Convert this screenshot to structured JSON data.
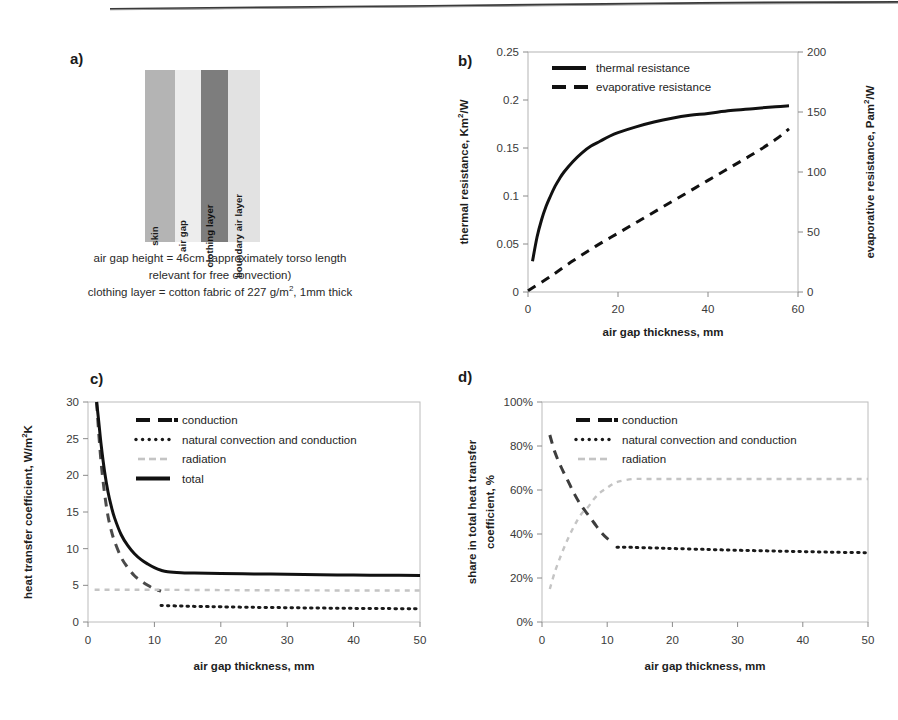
{
  "figure": {
    "panel_a": {
      "letter": "a)",
      "layers": [
        {
          "name": "skin",
          "label": "skin",
          "color": "#b4b4b4"
        },
        {
          "name": "air gap",
          "label": "air gap",
          "color": "#ededed"
        },
        {
          "name": "clothing layer",
          "label": "clothing layer",
          "color": "#7d7d7d"
        },
        {
          "name": "boundary air layer",
          "label": "boundary air layer",
          "color": "#e2e2e2"
        }
      ],
      "caption_line1": "air gap height = 46cm (approximately torso length",
      "caption_line2": "relevant for free convection)",
      "caption_line3_a": "clothing layer = cotton fabric of 227 g/m",
      "caption_line3_sup": "2",
      "caption_line3_b": ", 1mm thick"
    },
    "panel_b": {
      "letter": "b)"
    },
    "panel_c": {
      "letter": "c)"
    },
    "panel_d": {
      "letter": "d)"
    }
  },
  "chart_data": [
    {
      "id": "panel_b",
      "type": "line",
      "title": "",
      "xlabel": "air gap thickness, mm",
      "ylabel": "thermal resistance, Km2/W",
      "ylabel_main": "thermal resistance, Km",
      "ylabel_sup": "2",
      "ylabel_tail": "/W",
      "y2label_main": "evaporative resistance, Pam",
      "y2label_sup": "2",
      "y2label_tail": "/W",
      "xlim": [
        0,
        60
      ],
      "ylim": [
        0,
        0.25
      ],
      "y2lim": [
        0,
        200
      ],
      "xticks": [
        0,
        20,
        40,
        60
      ],
      "yticks": [
        "0",
        "0.05",
        "0.1",
        "0.15",
        "0.2",
        "0.25"
      ],
      "y2ticks": [
        "0",
        "50",
        "100",
        "150",
        "200"
      ],
      "grid": false,
      "legend_position": "top-center",
      "series": [
        {
          "name": "thermal resistance",
          "style": "solid",
          "axis": "left",
          "x": [
            1,
            2,
            3,
            4,
            5,
            6,
            7,
            8,
            10,
            12,
            14,
            16,
            18,
            20,
            24,
            28,
            32,
            36,
            40,
            45,
            50,
            55,
            58
          ],
          "values": [
            0.032,
            0.057,
            0.075,
            0.089,
            0.1,
            0.11,
            0.118,
            0.125,
            0.136,
            0.145,
            0.152,
            0.157,
            0.162,
            0.166,
            0.172,
            0.177,
            0.181,
            0.184,
            0.186,
            0.189,
            0.191,
            0.193,
            0.194
          ]
        },
        {
          "name": "evaporative resistance",
          "style": "dashed",
          "axis": "right",
          "x": [
            0,
            5,
            10,
            15,
            20,
            25,
            30,
            35,
            40,
            45,
            50,
            55,
            58
          ],
          "values": [
            1,
            13,
            26,
            38,
            49,
            60,
            71,
            82,
            93,
            104,
            115,
            127,
            136
          ]
        }
      ]
    },
    {
      "id": "panel_c",
      "type": "line",
      "title": "",
      "xlabel": "air gap thickness, mm",
      "ylabel_main": "heat transfer coefficient, W/m",
      "ylabel_sup": "2",
      "ylabel_tail": "K",
      "xlim": [
        0,
        50
      ],
      "ylim": [
        0,
        30
      ],
      "xticks": [
        0,
        10,
        20,
        30,
        40,
        50
      ],
      "yticks": [
        "0",
        "5",
        "10",
        "15",
        "20",
        "25",
        "30"
      ],
      "grid": false,
      "legend_position": "top-center",
      "series": [
        {
          "name": "conduction",
          "style": "dashed",
          "color": "#4a4a4a",
          "x": [
            1.3,
            1.6,
            2,
            2.5,
            3,
            3.5,
            4,
            5,
            6,
            7,
            8,
            9,
            10,
            11
          ],
          "values": [
            30,
            26,
            21.5,
            17.5,
            14.5,
            12.5,
            11,
            8.8,
            7.4,
            6.3,
            5.6,
            5.0,
            4.5,
            4.2
          ]
        },
        {
          "name": "natural convection and conduction",
          "style": "dotted",
          "color": "#1a1a1a",
          "x": [
            11,
            12,
            14,
            16,
            18,
            20,
            25,
            30,
            35,
            40,
            45,
            50
          ],
          "values": [
            2.25,
            2.22,
            2.18,
            2.13,
            2.1,
            2.07,
            2.0,
            1.95,
            1.9,
            1.86,
            1.83,
            1.8
          ]
        },
        {
          "name": "radiation",
          "style": "faint-dash",
          "color": "#c4c4c4",
          "x": [
            1,
            5,
            10,
            20,
            30,
            40,
            50
          ],
          "values": [
            4.4,
            4.4,
            4.4,
            4.35,
            4.32,
            4.3,
            4.3
          ]
        },
        {
          "name": "total",
          "style": "solid",
          "color": "#111111",
          "x": [
            1.3,
            1.6,
            2,
            2.5,
            3,
            3.5,
            4,
            5,
            6,
            7,
            8,
            9,
            10,
            11,
            12,
            14,
            16,
            20,
            25,
            30,
            35,
            40,
            45,
            50
          ],
          "values": [
            30,
            27.5,
            24,
            20.5,
            17.8,
            15.8,
            14.2,
            11.9,
            10.4,
            9.3,
            8.5,
            7.9,
            7.4,
            7.05,
            6.85,
            6.72,
            6.68,
            6.62,
            6.56,
            6.5,
            6.45,
            6.4,
            6.37,
            6.34
          ]
        }
      ]
    },
    {
      "id": "panel_d",
      "type": "line",
      "title": "",
      "xlabel": "air gap thickness, mm",
      "ylabel_line1": "share in total heat transfer",
      "ylabel_line2": "coefficient, %",
      "xlim": [
        0,
        50
      ],
      "ylim": [
        0,
        100
      ],
      "xticks": [
        0,
        10,
        20,
        30,
        40,
        50
      ],
      "yticks": [
        "0%",
        "20%",
        "40%",
        "60%",
        "80%",
        "100%"
      ],
      "grid": false,
      "legend_position": "top-center",
      "series": [
        {
          "name": "conduction",
          "style": "dashed",
          "color": "#3d3d3d",
          "x": [
            1.2,
            2,
            3,
            4,
            5,
            6,
            7,
            8,
            9,
            10,
            11
          ],
          "values": [
            85,
            77,
            70,
            64,
            58,
            53,
            49,
            45,
            41,
            38,
            36
          ]
        },
        {
          "name": "natural convection and conduction",
          "style": "dotted",
          "color": "#1a1a1a",
          "x": [
            11.5,
            13,
            15,
            18,
            20,
            25,
            30,
            35,
            40,
            45,
            50
          ],
          "values": [
            34,
            34,
            33.8,
            33.6,
            33.4,
            33.0,
            32.6,
            32.3,
            32.0,
            31.7,
            31.5
          ]
        },
        {
          "name": "radiation",
          "style": "faint-dash",
          "color": "#c4c4c4",
          "x": [
            1.2,
            2,
            3,
            4,
            5,
            6,
            7,
            8,
            9,
            10,
            11,
            12,
            14,
            16,
            20,
            25,
            30,
            35,
            40,
            45,
            50
          ],
          "values": [
            15,
            23,
            31,
            38,
            44,
            49,
            52,
            56,
            59,
            61,
            63,
            64,
            65,
            65,
            65,
            65,
            65,
            65,
            65,
            65,
            65
          ]
        }
      ]
    }
  ],
  "legends": {
    "panel_b": [
      {
        "label": "thermal resistance",
        "style": "solid"
      },
      {
        "label": "evaporative resistance",
        "style": "dashed"
      }
    ],
    "panel_c": [
      {
        "label": "conduction",
        "style": "dashed"
      },
      {
        "label": "natural convection and conduction",
        "style": "dotted"
      },
      {
        "label": "radiation",
        "style": "faint-dash"
      },
      {
        "label": "total",
        "style": "solid"
      }
    ],
    "panel_d": [
      {
        "label": "conduction",
        "style": "dashed"
      },
      {
        "label": "natural convection and conduction",
        "style": "dotted"
      },
      {
        "label": "radiation",
        "style": "faint-dash"
      }
    ]
  },
  "colors": {
    "ink": "#1a1a1a",
    "axis": "#8a8a8a",
    "faint": "#c4c4c4",
    "skin": "#b4b4b4",
    "air_gap": "#ededed",
    "clothing": "#7d7d7d",
    "boundary": "#e2e2e2"
  }
}
